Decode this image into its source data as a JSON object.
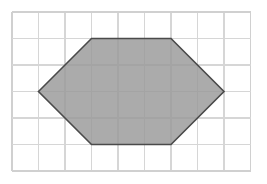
{
  "figure": {
    "background_color": "#ffffff",
    "width": 267,
    "height": 184
  },
  "grid": {
    "name": "square-grid",
    "columns": 9,
    "rows": 6,
    "cell_size": 26.5,
    "origin_x": 12,
    "origin_y": 12,
    "line_color": "#d6d6d6",
    "line_width": 1.1,
    "border_color": "#d0d0d0",
    "border_width": 1.2
  },
  "chart_data": {
    "type": "scatter",
    "xlabel": "",
    "ylabel": "",
    "xlim": [
      0,
      9
    ],
    "ylim": [
      0,
      6
    ],
    "grid": true,
    "legend": "none",
    "shapes": [
      {
        "name": "hexagon",
        "kind": "polygon",
        "sides": 6,
        "fill": "#999999",
        "stroke": "#4a4a4a",
        "stroke_width": 1.6,
        "vertices_grid": [
          [
            1,
            3
          ],
          [
            3,
            1
          ],
          [
            6,
            1
          ],
          [
            8,
            3
          ],
          [
            6,
            5
          ],
          [
            3,
            5
          ]
        ],
        "vertices_px": [
          [
            38.5,
            91.5
          ],
          [
            91.5,
            38.5
          ],
          [
            171.0,
            38.5
          ],
          [
            224.0,
            91.5
          ],
          [
            171.0,
            144.5
          ],
          [
            91.5,
            144.5
          ]
        ]
      }
    ]
  }
}
